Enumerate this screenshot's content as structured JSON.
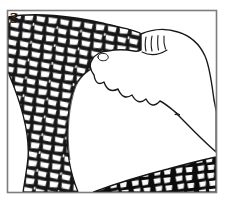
{
  "figure": {
    "step_label": "3.",
    "colors": {
      "ink": "#1a1a1a",
      "frame": "#7d7d7d",
      "background": "#ffffff",
      "mesh_crease": "#141414",
      "mesh_cell": "#ffffff"
    }
  }
}
